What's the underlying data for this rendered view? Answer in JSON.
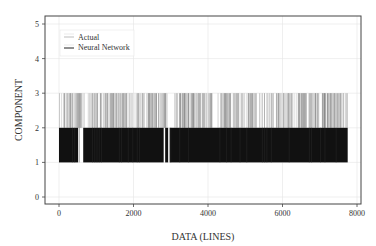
{
  "chart_data": {
    "type": "line",
    "title": "",
    "xlabel": "DATA (LINES)",
    "ylabel": "COMPONENT",
    "xlim": [
      -400,
      8200
    ],
    "ylim": [
      -0.2,
      5.2
    ],
    "xticks": [
      0,
      2000,
      4000,
      6000,
      8000
    ],
    "yticks": [
      0,
      1,
      2,
      3,
      4,
      5
    ],
    "grid": true,
    "legend_position": "upper left",
    "n_points": 7750,
    "series": [
      {
        "name": "Actual",
        "color": "#9a9a9a",
        "style": "vertical lines (impulse) between component 2 and 3",
        "value_levels": [
          2,
          3
        ],
        "x_range": [
          0,
          7750
        ],
        "description": "Actual component alternates between 2 and 3; drawn as dense gray vertical strokes from y=2 to y=3 across the data range"
      },
      {
        "name": "Neural Network",
        "color": "#111111",
        "style": "vertical lines (impulse) between component 1 and 2",
        "value_levels": [
          1,
          2
        ],
        "x_range": [
          0,
          7750
        ],
        "gaps": [
          [
            510,
            650
          ],
          [
            2810,
            2850
          ],
          [
            2930,
            2970
          ]
        ],
        "description": "Neural network prediction forms an almost solid black band from y=1 to y=2, with small gaps near x≈520–650 and ≈2820–2960"
      }
    ]
  },
  "legend": {
    "items": [
      {
        "label": "Actual",
        "color": "#9a9a9a"
      },
      {
        "label": "Neural Network",
        "color": "#111111"
      }
    ]
  },
  "axes": {
    "x_tick_labels": [
      "0",
      "2000",
      "4000",
      "6000",
      "8000"
    ],
    "y_tick_labels": [
      "0",
      "1",
      "2",
      "3",
      "4",
      "5"
    ],
    "xlabel": "DATA (LINES)",
    "ylabel": "COMPONENT"
  }
}
